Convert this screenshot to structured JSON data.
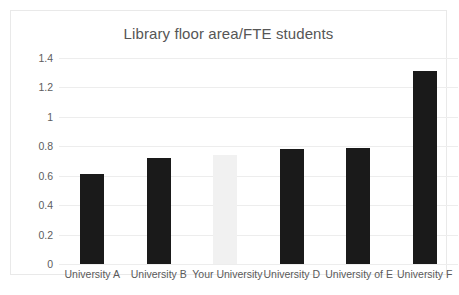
{
  "chart_data": {
    "type": "bar",
    "title": "Library floor area/FTE students",
    "xlabel": "",
    "ylabel": "",
    "ylim": [
      0,
      1.4
    ],
    "grid": "horizontal",
    "legend": "none",
    "categories": [
      "University A",
      "University B",
      "Your University",
      "University D",
      "University of E",
      "University F"
    ],
    "values": [
      0.61,
      0.72,
      0.74,
      0.785,
      0.79,
      1.31
    ],
    "bar_colors": [
      "#1a1a1a",
      "#1a1a1a",
      "#f1f1f1",
      "#1a1a1a",
      "#1a1a1a",
      "#1a1a1a"
    ],
    "highlight_category": "Your University",
    "ytick_labels": [
      "0",
      "0.2",
      "0.4",
      "0.6",
      "0.8",
      "1",
      "1.2",
      "1.4"
    ],
    "ytick_values": [
      0,
      0.2,
      0.4,
      0.6,
      0.8,
      1,
      1.2,
      1.4
    ],
    "colors": {
      "bar_default": "#1a1a1a",
      "bar_highlight": "#f1f1f1",
      "gridline": "#ededed",
      "title_text": "#565656",
      "axis_text": "#5a5a5a",
      "plot_background": "#ffffff",
      "frame_border": "#e9e9e9"
    }
  }
}
